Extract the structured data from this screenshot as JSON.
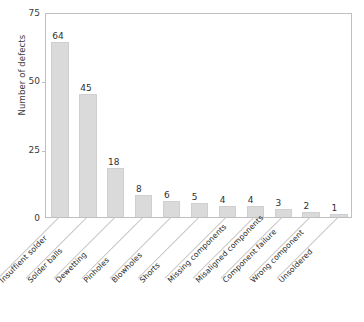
{
  "chart_data": {
    "type": "bar",
    "title": "",
    "subtitle": "",
    "xlabel": "",
    "ylabel": "Number of defects",
    "ylim": [
      0,
      75
    ],
    "yticks": [
      0,
      25,
      50,
      75
    ],
    "ytick_labels": [
      "0",
      "25",
      "50",
      "75"
    ],
    "grid": false,
    "legend": null,
    "bar_color": "#dadada",
    "bar_edge_color": "#cfcfcf",
    "axis_color": "#bfbfbf",
    "text_color": "#2f2f2f",
    "label_rotation_deg": 45,
    "categories": [
      "Insuffient solder",
      "Solder balls",
      "Dewetting",
      "Pinholes",
      "Blowholes",
      "Shorts",
      "Missing components",
      "Misaligned components",
      "Component failure",
      "Wrong component",
      "Unsoldered"
    ],
    "values": [
      64,
      45,
      18,
      8,
      6,
      5,
      4,
      4,
      3,
      2,
      1
    ],
    "data_labels": [
      "64",
      "45",
      "18",
      "8",
      "6",
      "5",
      "4",
      "4",
      "3",
      "2",
      "1"
    ]
  },
  "caption": {
    "text": ""
  }
}
